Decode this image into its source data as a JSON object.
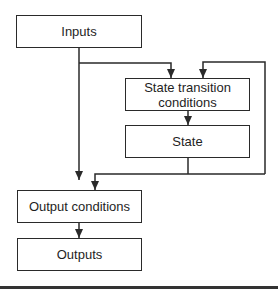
{
  "diagram": {
    "nodes": {
      "inputs": "Inputs",
      "state_transition_conditions": "State transition conditions",
      "state": "State",
      "output_conditions": "Output conditions",
      "outputs": "Outputs"
    },
    "edges": [
      {
        "from": "inputs",
        "to": "state_transition_conditions"
      },
      {
        "from": "inputs",
        "to": "output_conditions"
      },
      {
        "from": "state",
        "to": "state_transition_conditions",
        "label": "feedback loop"
      },
      {
        "from": "state_transition_conditions",
        "to": "state"
      },
      {
        "from": "state",
        "to": "output_conditions"
      },
      {
        "from": "output_conditions",
        "to": "outputs"
      }
    ],
    "colors": {
      "line": "#2a2a2a",
      "background": "#ffffff"
    }
  }
}
